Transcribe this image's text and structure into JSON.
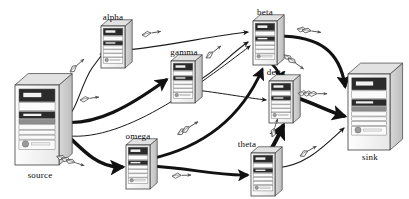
{
  "diagram": {
    "background": "#ffffff",
    "line_color": "#1a1a1a",
    "packet_color": "#5a5a5a",
    "chassis_face": "#f0f0f0",
    "chassis_side": "#d2d2d2",
    "chassis_top": "#e2e2e2",
    "chassis_stroke": "#3d3d3d",
    "bay_dark": "#2b2b2b",
    "bay_mid": "#8e8e8e",
    "bay_light": "#fbfbfb"
  },
  "nodes": [
    {
      "id": "source",
      "label": "source",
      "size": "large",
      "x": 15,
      "y": 85,
      "w": 44,
      "h": 80,
      "label_x": 16,
      "label_y": 170,
      "label_w": 48
    },
    {
      "id": "alpha",
      "label": "alpha",
      "size": "small",
      "x": 101,
      "y": 26,
      "w": 24,
      "h": 42,
      "label_x": 96,
      "label_y": 12,
      "label_w": 34
    },
    {
      "id": "gamma",
      "label": "gamma",
      "size": "small",
      "x": 171,
      "y": 61,
      "w": 24,
      "h": 42,
      "label_x": 163,
      "label_y": 47,
      "label_w": 42
    },
    {
      "id": "beta",
      "label": "beta",
      "size": "small",
      "x": 253,
      "y": 21,
      "w": 24,
      "h": 44,
      "label_x": 249,
      "label_y": 7,
      "label_w": 32
    },
    {
      "id": "delta",
      "label": "delta",
      "size": "small",
      "x": 269,
      "y": 81,
      "w": 24,
      "h": 42,
      "label_x": 259,
      "label_y": 67,
      "label_w": 34
    },
    {
      "id": "omega",
      "label": "omega",
      "size": "small",
      "x": 126,
      "y": 145,
      "w": 24,
      "h": 44,
      "label_x": 117,
      "label_y": 131,
      "label_w": 42
    },
    {
      "id": "theta",
      "label": "theta",
      "size": "small",
      "x": 251,
      "y": 153,
      "w": 24,
      "h": 43,
      "label_x": 230,
      "label_y": 139,
      "label_w": 34
    },
    {
      "id": "sink",
      "label": "sink",
      "size": "large",
      "x": 348,
      "y": 74,
      "w": 42,
      "h": 76,
      "label_x": 350,
      "label_y": 152,
      "label_w": 40
    }
  ],
  "edges": [
    {
      "id": "source-alpha",
      "from": "source",
      "to": "alpha",
      "weight": "thin",
      "width": 1.1,
      "path": "M 64 118 C 76 116 80 86 92 68 L 104 52"
    },
    {
      "id": "alpha-beta",
      "from": "alpha",
      "to": "beta",
      "weight": "thin",
      "width": 1.1,
      "path": "M 126 50 C 170 46 210 36 248 32"
    },
    {
      "id": "source-gamma",
      "from": "source",
      "to": "gamma",
      "weight": "thick",
      "width": 3.2,
      "path": "M 62 122 C 96 126 130 106 166 80"
    },
    {
      "id": "gamma-beta",
      "from": "gamma",
      "to": "beta",
      "weight": "thin",
      "width": 1.1,
      "path": "M 196 82 C 216 72 230 54 248 42"
    },
    {
      "id": "source-omega",
      "from": "source",
      "to": "omega",
      "weight": "thick",
      "width": 3.6,
      "path": "M 62 130 C 86 154 100 168 122 167"
    },
    {
      "id": "omega-theta",
      "from": "omega",
      "to": "theta",
      "weight": "thick",
      "width": 2.8,
      "path": "M 151 166 C 190 168 216 176 247 175"
    },
    {
      "id": "omega-beta",
      "from": "omega",
      "to": "beta",
      "weight": "thick",
      "width": 3.0,
      "path": "M 150 159 C 200 148 240 120 262 70"
    },
    {
      "id": "theta-delta",
      "from": "theta",
      "to": "delta",
      "weight": "thick",
      "width": 4.0,
      "path": "M 268 154 C 276 142 280 132 283 126"
    },
    {
      "id": "beta-sink",
      "from": "beta",
      "to": "sink",
      "weight": "thick",
      "width": 3.2,
      "path": "M 278 36 C 320 36 340 52 345 86"
    },
    {
      "id": "delta-sink",
      "from": "delta",
      "to": "sink",
      "weight": "thick",
      "width": 3.6,
      "path": "M 292 96 C 316 104 330 112 344 116"
    },
    {
      "id": "theta-sink",
      "from": "theta",
      "to": "sink",
      "weight": "thin",
      "width": 1.1,
      "path": "M 276 168 C 306 166 324 146 344 128"
    },
    {
      "id": "gamma-delta",
      "from": "gamma",
      "to": "delta",
      "weight": "thin",
      "width": 1.0,
      "path": "M 196 90 C 228 94 248 98 266 100"
    },
    {
      "id": "beta-delta",
      "from": "beta",
      "to": "delta",
      "weight": "thick",
      "width": 2.6,
      "path": "M 272 64 C 278 70 280 74 280 79"
    },
    {
      "id": "source-beta-long",
      "from": "source",
      "to": "beta",
      "weight": "thin",
      "width": 1.0,
      "path": "M 62 135 C 120 146 200 84 250 46"
    }
  ],
  "packets": [
    {
      "id": "pkt-source-alpha",
      "on": "source-alpha",
      "count": 1,
      "x": 70,
      "y": 72,
      "rot": -38
    },
    {
      "id": "pkt-alpha-beta",
      "on": "alpha-beta",
      "count": 1,
      "x": 142,
      "y": 35,
      "rot": -6
    },
    {
      "id": "pkt-source-gamma",
      "on": "source-gamma",
      "count": 1,
      "x": 80,
      "y": 100,
      "rot": -4
    },
    {
      "id": "pkt-gamma-beta",
      "on": "gamma-beta",
      "count": 1,
      "x": 206,
      "y": 58,
      "rot": -34
    },
    {
      "id": "pkt-source-omega",
      "on": "source-omega",
      "count": 3,
      "x": 66,
      "y": 160,
      "rot": 22
    },
    {
      "id": "pkt-omega-theta",
      "on": "omega-theta",
      "count": 1,
      "x": 172,
      "y": 176,
      "rot": 2
    },
    {
      "id": "pkt-omega-beta",
      "on": "omega-beta",
      "count": 2,
      "x": 182,
      "y": 132,
      "rot": -28
    },
    {
      "id": "pkt-theta-delta",
      "on": "theta-delta",
      "count": 1,
      "x": 272,
      "y": 137,
      "rot": -68
    },
    {
      "id": "pkt-beta-sink",
      "on": "beta-sink",
      "count": 2,
      "x": 302,
      "y": 30,
      "rot": 12
    },
    {
      "id": "pkt-delta-sink",
      "on": "delta-sink",
      "count": 3,
      "x": 308,
      "y": 94,
      "rot": 4
    },
    {
      "id": "pkt-theta-sink",
      "on": "theta-sink",
      "count": 1,
      "x": 300,
      "y": 156,
      "rot": -26
    },
    {
      "id": "pkt-beta-delta",
      "on": "beta-delta",
      "count": 2,
      "x": 288,
      "y": 58,
      "rot": 40
    }
  ]
}
